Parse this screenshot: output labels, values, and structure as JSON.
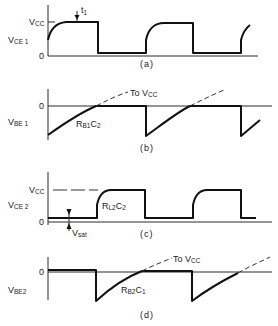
{
  "figure": {
    "panels": [
      {
        "id": "a",
        "caption": "(a)",
        "ylabel_main": "V",
        "ylabel_sub": "CE 1",
        "level_labels": {
          "high_main": "V",
          "high_sub": "CC",
          "zero": "0"
        },
        "marker_main": "t",
        "marker_sub": "1"
      },
      {
        "id": "b",
        "caption": "(b)",
        "ylabel_main": "V",
        "ylabel_sub": "BE 1",
        "level_labels": {
          "zero": "0"
        },
        "dashed_label_main": "To V",
        "dashed_label_sub": "CC",
        "curve_label_main": "R",
        "curve_label_sub1": "B1",
        "curve_label_c": "C",
        "curve_label_sub2": "2"
      },
      {
        "id": "c",
        "caption": "(c)",
        "ylabel_main": "V",
        "ylabel_sub": "CE 2",
        "level_labels": {
          "high_main": "V",
          "high_sub": "CC",
          "zero": "0"
        },
        "curve_label_main": "R",
        "curve_label_sub1": "L2",
        "curve_label_c": "C",
        "curve_label_sub2": "2",
        "sat_label_main": "V",
        "sat_label_sub": "sat"
      },
      {
        "id": "d",
        "caption": "(d)",
        "ylabel_main": "V",
        "ylabel_sub": "BE2",
        "level_labels": {
          "zero": "0"
        },
        "dashed_label_main": "To V",
        "dashed_label_sub": "CC",
        "curve_label_main": "R",
        "curve_label_sub1": "B2",
        "curve_label_c": "C",
        "curve_label_sub2": "1"
      }
    ]
  }
}
